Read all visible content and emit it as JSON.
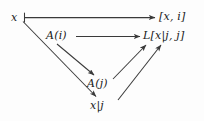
{
  "diagram": {
    "type": "commutative-diagram",
    "width": 204,
    "height": 121,
    "background_color": "#fdfdfd",
    "line_color": "#3a3a3a",
    "text_color": "#1a1a1a",
    "nodes": [
      {
        "id": "x",
        "label": "x",
        "x": 11,
        "y": 12,
        "role": "source-element"
      },
      {
        "id": "xi",
        "label": "[x, i]",
        "x": 159,
        "y": 11,
        "role": "target-pair"
      },
      {
        "id": "ai",
        "label": "A(i)",
        "x": 46,
        "y": 30,
        "role": "object-ai"
      },
      {
        "id": "lxjj",
        "label": "L[x|j, j]",
        "x": 143,
        "y": 30,
        "role": "object-lxjj"
      },
      {
        "id": "aj",
        "label": "A(j)",
        "x": 87,
        "y": 78,
        "role": "object-aj"
      },
      {
        "id": "xbarj",
        "label": "x|j",
        "x": 90,
        "y": 100,
        "role": "restricted-element"
      }
    ],
    "edges": [
      {
        "id": "x-to-xi",
        "from": "x",
        "to": "xi",
        "style": "mapsto",
        "label": ""
      },
      {
        "id": "x-to-xbarj",
        "from": "x",
        "to": "xbarj",
        "style": "arrow",
        "label": ""
      },
      {
        "id": "ai-to-lxjj",
        "from": "ai",
        "to": "lxjj",
        "style": "arrow",
        "label": ""
      },
      {
        "id": "ai-to-aj",
        "from": "ai",
        "to": "aj",
        "style": "arrow",
        "label": ""
      },
      {
        "id": "aj-to-lxjj",
        "from": "aj",
        "to": "lxjj",
        "style": "arrow",
        "label": ""
      },
      {
        "id": "xbarj-to-lxjj",
        "from": "xbarj",
        "to": "lxjj",
        "style": "arrow",
        "label": ""
      }
    ]
  }
}
